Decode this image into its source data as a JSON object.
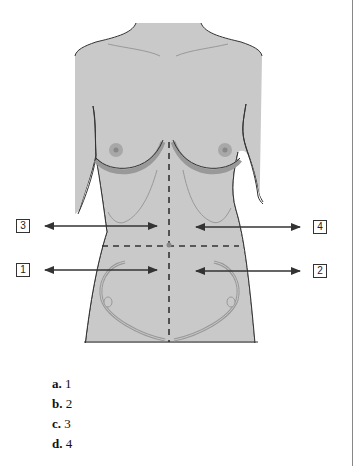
{
  "diagram": {
    "type": "anatomical-torso-quadrants",
    "colors": {
      "skin": "#c9c9c9",
      "outline": "#333333",
      "areola": "#a8a8a8",
      "nipple": "#8a8a8a",
      "ribs": "#9a9a9a",
      "dashed": "#333333"
    },
    "labels": [
      {
        "id": "3",
        "side": "left",
        "region": "upper"
      },
      {
        "id": "4",
        "side": "right",
        "region": "upper"
      },
      {
        "id": "1",
        "side": "left",
        "region": "lower"
      },
      {
        "id": "2",
        "side": "right",
        "region": "lower"
      }
    ]
  },
  "options": [
    {
      "letter": "a.",
      "value": "1"
    },
    {
      "letter": "b.",
      "value": "2"
    },
    {
      "letter": "c.",
      "value": "3"
    },
    {
      "letter": "d.",
      "value": "4"
    }
  ]
}
